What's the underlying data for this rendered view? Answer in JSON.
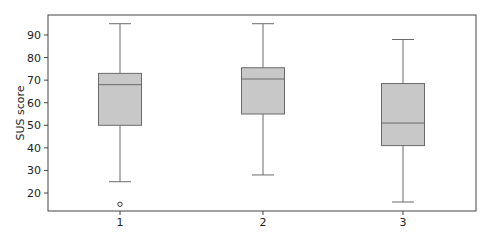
{
  "chart_data": {
    "type": "box",
    "title": "",
    "xlabel": "",
    "ylabel": "SUS score",
    "ylim": [
      10.5,
      98.5
    ],
    "yticks": [
      20,
      30,
      40,
      50,
      60,
      70,
      80,
      90
    ],
    "categories": [
      "1",
      "2",
      "3"
    ],
    "grid": false,
    "boxes": [
      {
        "label": "1",
        "whisker_low": 25,
        "q1": 50,
        "median": 68,
        "q3": 73,
        "whisker_high": 95,
        "outliers": [
          15
        ]
      },
      {
        "label": "2",
        "whisker_low": 28,
        "q1": 55,
        "median": 70.5,
        "q3": 75.5,
        "whisker_high": 95,
        "outliers": []
      },
      {
        "label": "3",
        "whisker_low": 16,
        "q1": 41,
        "median": 51,
        "q3": 68.5,
        "whisker_high": 88,
        "outliers": []
      }
    ],
    "colors": {
      "box_fill": "#c8c8c8",
      "box_edge": "#6a6a6a",
      "whisker": "#6a6a6a",
      "median": "#6a6a6a",
      "axis": "#444444"
    }
  }
}
